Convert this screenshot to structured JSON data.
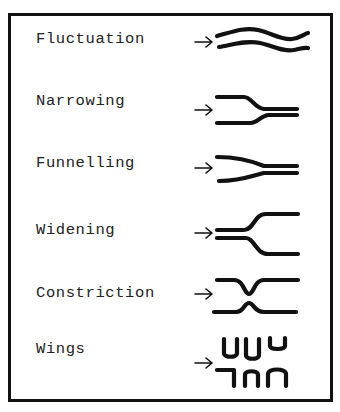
{
  "diagram": {
    "type": "legend",
    "colors": {
      "ink": "#111111",
      "background": "#ffffff"
    },
    "items": [
      {
        "label": "Fluctuation",
        "icon": "fluctuation-wavy-lines-icon"
      },
      {
        "label": "Narrowing",
        "icon": "narrowing-lines-icon"
      },
      {
        "label": "Funnelling",
        "icon": "funnelling-lines-icon"
      },
      {
        "label": "Widening",
        "icon": "widening-lines-icon"
      },
      {
        "label": "Constriction",
        "icon": "constriction-lines-icon"
      },
      {
        "label": "Wings",
        "icon": "wings-lines-icon"
      }
    ]
  }
}
